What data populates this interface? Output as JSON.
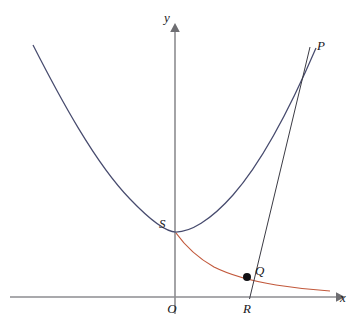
{
  "figure": {
    "background_color": "#ffffff",
    "axes": {
      "x_label": "x",
      "y_label": "y",
      "origin_label": "O",
      "x_axis_color": "#8d8d90",
      "y_axis_color": "#8d8d90"
    },
    "points": [
      {
        "label": "P",
        "role": "tangent-line-upper-endpoint"
      },
      {
        "label": "S",
        "role": "parabola-vertex"
      },
      {
        "label": "Q",
        "role": "intersection-on-hyperbola"
      },
      {
        "label": "R",
        "role": "x-axis-foot-of-line"
      },
      {
        "label": "O",
        "role": "origin"
      }
    ],
    "curves": [
      {
        "name": "parabola",
        "color": "#474b6e"
      },
      {
        "name": "hyperbola",
        "color": "#c2593c"
      },
      {
        "name": "tangent-line",
        "color": "#3b3b44"
      }
    ]
  },
  "chart_data": {
    "type": "line",
    "xlabel": "x",
    "ylabel": "y",
    "grid": false,
    "legend": "none",
    "axis_origin_px": {
      "x": 175,
      "y": 297
    },
    "xlim_px": [
      10,
      340
    ],
    "ylim_px": [
      25,
      297
    ],
    "annotations": [
      {
        "text": "y",
        "x_px": 172,
        "y_px": 20,
        "role": "y-axis-label"
      },
      {
        "text": "x",
        "x_px": 342,
        "y_px": 297,
        "role": "x-axis-label"
      },
      {
        "text": "O",
        "x_px": 172,
        "y_px": 311,
        "role": "origin-label"
      },
      {
        "text": "P",
        "x_px": 320,
        "y_px": 46,
        "role": "point-label"
      },
      {
        "text": "S",
        "x_px": 163,
        "y_px": 224,
        "role": "point-label"
      },
      {
        "text": "Q",
        "x_px": 259,
        "y_px": 271,
        "role": "point-label"
      },
      {
        "text": "R",
        "x_px": 247,
        "y_px": 311,
        "role": "point-label"
      }
    ],
    "series": [
      {
        "name": "parabola",
        "color": "#474b6e",
        "points_px": [
          [
            33,
            45
          ],
          [
            41,
            62
          ],
          [
            50,
            80
          ],
          [
            59,
            97
          ],
          [
            68,
            113
          ],
          [
            77,
            128
          ],
          [
            86,
            142
          ],
          [
            95,
            156
          ],
          [
            104,
            168
          ],
          [
            113,
            180
          ],
          [
            122,
            191
          ],
          [
            131,
            200
          ],
          [
            140,
            209
          ],
          [
            149,
            217
          ],
          [
            158,
            224
          ],
          [
            167,
            229
          ],
          [
            176,
            232
          ],
          [
            185,
            233
          ],
          [
            194,
            232
          ],
          [
            203,
            229
          ],
          [
            212,
            224
          ],
          [
            221,
            217
          ],
          [
            230,
            209
          ],
          [
            239,
            199
          ],
          [
            248,
            187
          ],
          [
            257,
            174
          ],
          [
            266,
            159
          ],
          [
            275,
            143
          ],
          [
            284,
            125
          ],
          [
            293,
            106
          ],
          [
            302,
            85
          ],
          [
            309,
            68
          ],
          [
            313,
            56
          ],
          [
            316,
            48
          ]
        ]
      },
      {
        "name": "hyperbola",
        "color": "#c2593c",
        "points_px": [
          [
            176,
            233
          ],
          [
            180,
            239
          ],
          [
            184,
            245
          ],
          [
            189,
            250
          ],
          [
            194,
            255
          ],
          [
            200,
            260
          ],
          [
            206,
            264
          ],
          [
            212,
            267
          ],
          [
            218,
            270
          ],
          [
            224,
            272
          ],
          [
            231,
            274
          ],
          [
            238,
            276
          ],
          [
            245,
            277
          ],
          [
            252,
            279
          ],
          [
            260,
            280
          ],
          [
            268,
            282
          ],
          [
            276,
            283
          ],
          [
            284,
            285
          ],
          [
            292,
            286
          ],
          [
            300,
            287
          ],
          [
            308,
            288
          ],
          [
            316,
            289
          ],
          [
            324,
            290
          ],
          [
            330,
            291
          ]
        ]
      },
      {
        "name": "tangent-line",
        "color": "#3b3b44",
        "points_px": [
          [
            310,
            47
          ],
          [
            250,
            297
          ]
        ]
      }
    ],
    "markers": [
      {
        "label": "Q",
        "x_px": 247,
        "y_px": 277,
        "color": "#101014",
        "radius_px": 4
      }
    ]
  }
}
